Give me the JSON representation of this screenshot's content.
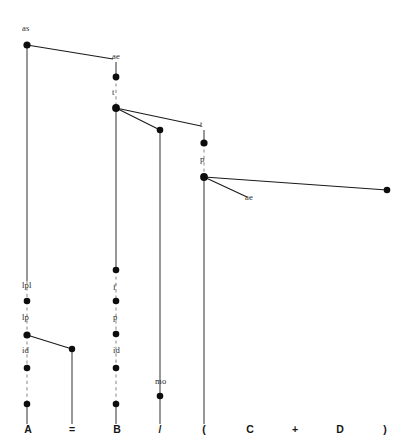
{
  "diagram": {
    "colors": {
      "background": "#ffffff",
      "edge": "#1a1a1a",
      "spine": "#3a3a3a",
      "spine_dashed": "#8d8d8d",
      "node": "#0d0d0d",
      "node_label": "#2b2b2b",
      "terminal": "#151515"
    },
    "terminals": [
      {
        "id": "t-A",
        "label": "A",
        "x": 28,
        "y": 433
      },
      {
        "id": "t-eq",
        "label": "=",
        "x": 72,
        "y": 433
      },
      {
        "id": "t-B",
        "label": "B",
        "x": 117,
        "y": 433
      },
      {
        "id": "t-slash",
        "label": "/",
        "x": 160,
        "y": 433
      },
      {
        "id": "t-lparen",
        "label": "(",
        "x": 204,
        "y": 433
      },
      {
        "id": "t-C",
        "label": "C",
        "x": 250,
        "y": 433
      },
      {
        "id": "t-plus",
        "label": "+",
        "x": 295,
        "y": 433
      },
      {
        "id": "t-D",
        "label": "D",
        "x": 340,
        "y": 433
      },
      {
        "id": "t-rparen",
        "label": ")",
        "x": 385,
        "y": 433
      }
    ],
    "node_labels": [
      {
        "id": "lbl-as-root",
        "text": "as",
        "x": 22,
        "y": 31
      },
      {
        "id": "lbl-ae-top",
        "text": "ae",
        "x": 112,
        "y": 59
      },
      {
        "id": "lbl-t-b",
        "text": "t",
        "x": 112,
        "y": 95
      },
      {
        "id": "lbl-t-paren",
        "text": "t",
        "x": 200,
        "y": 127
      },
      {
        "id": "lbl-p-paren",
        "text": "p",
        "x": 200,
        "y": 162
      },
      {
        "id": "lbl-ae-right",
        "text": "ae",
        "x": 245,
        "y": 200
      },
      {
        "id": "lbl-lpl",
        "text": "lpl",
        "x": 22,
        "y": 288
      },
      {
        "id": "lbl-lp",
        "text": "lp",
        "x": 22,
        "y": 320
      },
      {
        "id": "lbl-id-a",
        "text": "id",
        "x": 22,
        "y": 353
      },
      {
        "id": "lbl-f",
        "text": "f",
        "x": 113,
        "y": 290
      },
      {
        "id": "lbl-p-b",
        "text": "p",
        "x": 113,
        "y": 320
      },
      {
        "id": "lbl-id-b",
        "text": "id",
        "x": 113,
        "y": 353
      },
      {
        "id": "lbl-mo",
        "text": "mo",
        "x": 155,
        "y": 384
      }
    ],
    "nodes": [
      {
        "id": "n-root-as",
        "x": 27,
        "y": 45,
        "r": 3.6
      },
      {
        "id": "n-ae-top",
        "x": 116,
        "y": 77,
        "r": 3.4
      },
      {
        "id": "n-t-b",
        "x": 116,
        "y": 108,
        "r": 3.9
      },
      {
        "id": "n-slash-top",
        "x": 160,
        "y": 130,
        "r": 3.3
      },
      {
        "id": "n-t-paren",
        "x": 204,
        "y": 143,
        "r": 3.6
      },
      {
        "id": "n-p-paren",
        "x": 204,
        "y": 177,
        "r": 3.9
      },
      {
        "id": "n-far-right",
        "x": 387,
        "y": 190,
        "r": 3.3
      },
      {
        "id": "n-a-lpl",
        "x": 27,
        "y": 301,
        "r": 3.3
      },
      {
        "id": "n-a-lp",
        "x": 27,
        "y": 335,
        "r": 3.6
      },
      {
        "id": "n-eq",
        "x": 72,
        "y": 349,
        "r": 3.2
      },
      {
        "id": "n-a-id",
        "x": 27,
        "y": 368,
        "r": 3.3
      },
      {
        "id": "n-a-bottom",
        "x": 27,
        "y": 404,
        "r": 3.3
      },
      {
        "id": "n-b-top",
        "x": 116,
        "y": 270,
        "r": 3.3
      },
      {
        "id": "n-b-f",
        "x": 116,
        "y": 301,
        "r": 3.3
      },
      {
        "id": "n-b-p",
        "x": 116,
        "y": 334,
        "r": 3.3
      },
      {
        "id": "n-b-id",
        "x": 116,
        "y": 368,
        "r": 3.3
      },
      {
        "id": "n-b-bottom",
        "x": 116,
        "y": 404,
        "r": 3.3
      },
      {
        "id": "n-mo",
        "x": 160,
        "y": 396,
        "r": 3.3
      }
    ],
    "edges": [
      {
        "id": "e-root-to-ae",
        "x1": 27,
        "y1": 45,
        "x2": 113,
        "y2": 59
      },
      {
        "id": "e-tb-to-tparen",
        "x1": 116,
        "y1": 108,
        "x2": 201,
        "y2": 126
      },
      {
        "id": "e-tb-to-slash",
        "x1": 116,
        "y1": 108,
        "x2": 160,
        "y2": 130
      },
      {
        "id": "e-pparen-to-right",
        "x1": 204,
        "y1": 177,
        "x2": 387,
        "y2": 190
      },
      {
        "id": "e-pparen-to-ae",
        "x1": 204,
        "y1": 177,
        "x2": 247,
        "y2": 197
      },
      {
        "id": "e-alp-to-eq",
        "x1": 27,
        "y1": 335,
        "x2": 72,
        "y2": 349
      }
    ],
    "spines": [
      {
        "id": "s-a-root",
        "x": 27,
        "y1": 45,
        "y2": 281,
        "dashed": false
      },
      {
        "id": "s-a-lpl",
        "x": 27,
        "y1": 281,
        "y2": 301,
        "dashed": true
      },
      {
        "id": "s-a-lp",
        "x": 27,
        "y1": 301,
        "y2": 335,
        "dashed": true
      },
      {
        "id": "s-a-id",
        "x": 27,
        "y1": 335,
        "y2": 368,
        "dashed": true
      },
      {
        "id": "s-a-low",
        "x": 27,
        "y1": 368,
        "y2": 404,
        "dashed": true
      },
      {
        "id": "s-a-term",
        "x": 27,
        "y1": 404,
        "y2": 424,
        "dashed": false
      },
      {
        "id": "s-eq",
        "x": 72,
        "y1": 349,
        "y2": 424,
        "dashed": false
      },
      {
        "id": "s-b-ae",
        "x": 116,
        "y1": 62,
        "y2": 77,
        "dashed": false
      },
      {
        "id": "s-b-t",
        "x": 116,
        "y1": 77,
        "y2": 108,
        "dashed": true
      },
      {
        "id": "s-b-main",
        "x": 116,
        "y1": 108,
        "y2": 270,
        "dashed": false
      },
      {
        "id": "s-b-f",
        "x": 116,
        "y1": 270,
        "y2": 301,
        "dashed": true
      },
      {
        "id": "s-b-p",
        "x": 116,
        "y1": 301,
        "y2": 334,
        "dashed": true
      },
      {
        "id": "s-b-id",
        "x": 116,
        "y1": 334,
        "y2": 368,
        "dashed": true
      },
      {
        "id": "s-b-low",
        "x": 116,
        "y1": 368,
        "y2": 404,
        "dashed": true
      },
      {
        "id": "s-b-term",
        "x": 116,
        "y1": 404,
        "y2": 424,
        "dashed": false
      },
      {
        "id": "s-slash",
        "x": 160,
        "y1": 130,
        "y2": 396,
        "dashed": false
      },
      {
        "id": "s-slash-low",
        "x": 160,
        "y1": 396,
        "y2": 424,
        "dashed": false
      },
      {
        "id": "s-paren-t",
        "x": 204,
        "y1": 130,
        "y2": 143,
        "dashed": false
      },
      {
        "id": "s-paren-p",
        "x": 204,
        "y1": 143,
        "y2": 177,
        "dashed": true
      },
      {
        "id": "s-paren-low",
        "x": 204,
        "y1": 177,
        "y2": 424,
        "dashed": false
      }
    ]
  }
}
